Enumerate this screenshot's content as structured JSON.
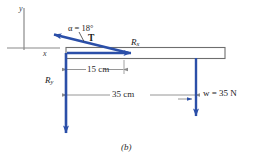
{
  "figure": {
    "caption": "(b)",
    "type": "free-body-diagram",
    "colors": {
      "force_blue": "#2b4fa8",
      "axis_gray": "#8a8a8a",
      "beam_outline": "#6e6e6e",
      "dimension_gray": "#8a8a8a",
      "text": "#1a1a1a"
    }
  },
  "axes": {
    "y_label": "y",
    "x_label": "x"
  },
  "forces": {
    "tension": {
      "label": "T",
      "angle_label": "α = 18°",
      "angle_value": 18,
      "angle_unit": "degrees",
      "direction": "up-left"
    },
    "reaction_x": {
      "label_base": "R",
      "label_sub": "x",
      "direction": "right"
    },
    "reaction_y": {
      "label_base": "R",
      "label_sub": "y",
      "direction": "down"
    },
    "weight": {
      "label": "w = 35 N",
      "value": 35,
      "unit": "N",
      "direction": "down"
    }
  },
  "dimensions": [
    {
      "label": "15 cm",
      "value": 15,
      "unit": "cm"
    },
    {
      "label": "35 cm",
      "value": 35,
      "unit": "cm"
    }
  ]
}
